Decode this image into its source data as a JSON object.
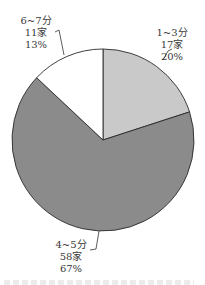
{
  "chart_data": {
    "type": "pie",
    "title": "",
    "categories": [
      "1~3分",
      "4~5分",
      "6~7分"
    ],
    "values": [
      17,
      58,
      11
    ],
    "percentages": [
      20,
      67,
      13
    ],
    "units": "家",
    "colors": [
      "#c9c9c9",
      "#8b8b8b",
      "#ffffff"
    ],
    "start_angle": "12 o'clock",
    "direction": "clockwise",
    "labels": [
      {
        "category": "1~3分",
        "count": "17家",
        "percent": "20%"
      },
      {
        "category": "4~5分",
        "count": "58家",
        "percent": "67%"
      },
      {
        "category": "6~7分",
        "count": "11家",
        "percent": "13%"
      }
    ],
    "legend": "none (direct labels with leader lines)"
  }
}
